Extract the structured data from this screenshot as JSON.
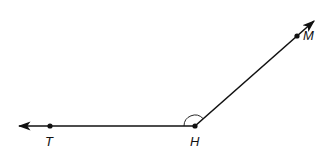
{
  "diagram": {
    "type": "angle",
    "stroke_color": "#111111",
    "background": "#ffffff",
    "vertex": {
      "label": "H"
    },
    "points": [
      {
        "id": "T",
        "label": "T"
      },
      {
        "id": "H",
        "label": "H"
      },
      {
        "id": "M",
        "label": "M"
      }
    ],
    "rays": [
      {
        "from": "H",
        "through": "T",
        "arrow": true
      },
      {
        "from": "H",
        "through": "M",
        "arrow": true
      }
    ],
    "angle_mark": {
      "vertex": "H",
      "style": "arc"
    }
  }
}
